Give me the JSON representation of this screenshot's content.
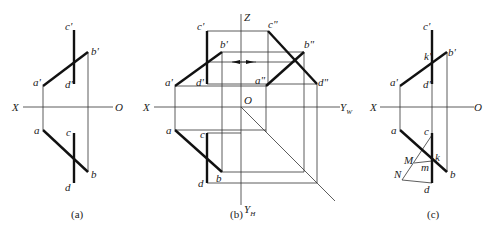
{
  "figure": {
    "panels": [
      {
        "id": "a",
        "caption": "(a)",
        "axis_labels": {
          "x": "X",
          "o": "O"
        },
        "points": {
          "c_prime": "c'",
          "b_prime": "b'",
          "a_prime": "a'",
          "d_prime": "d'",
          "a": "a",
          "c": "c",
          "b": "b",
          "d": "d"
        }
      },
      {
        "id": "b",
        "caption": "(b)",
        "axis_labels": {
          "x": "X",
          "z": "Z",
          "o": "O",
          "yw": "Y",
          "yw_sub": "W",
          "yh": "Y",
          "yh_sub": "H"
        },
        "points": {
          "c_prime": "c'",
          "b_prime": "b'",
          "a_prime": "a'",
          "d_prime": "d'",
          "a": "a",
          "c": "c",
          "b": "b",
          "d": "d",
          "c_dprime": "c\"",
          "b_dprime": "b\"",
          "a_dprime": "a\"",
          "d_dprime": "d\""
        }
      },
      {
        "id": "c",
        "caption": "(c)",
        "axis_labels": {
          "x": "X",
          "o": "O"
        },
        "points": {
          "c_prime": "c'",
          "k_prime": "k'",
          "b_prime": "b'",
          "a_prime": "a'",
          "d_prime": "d'",
          "a": "a",
          "c": "c",
          "k": "k",
          "M": "M",
          "m": "m",
          "N": "N",
          "b": "b",
          "d": "d"
        }
      }
    ]
  }
}
